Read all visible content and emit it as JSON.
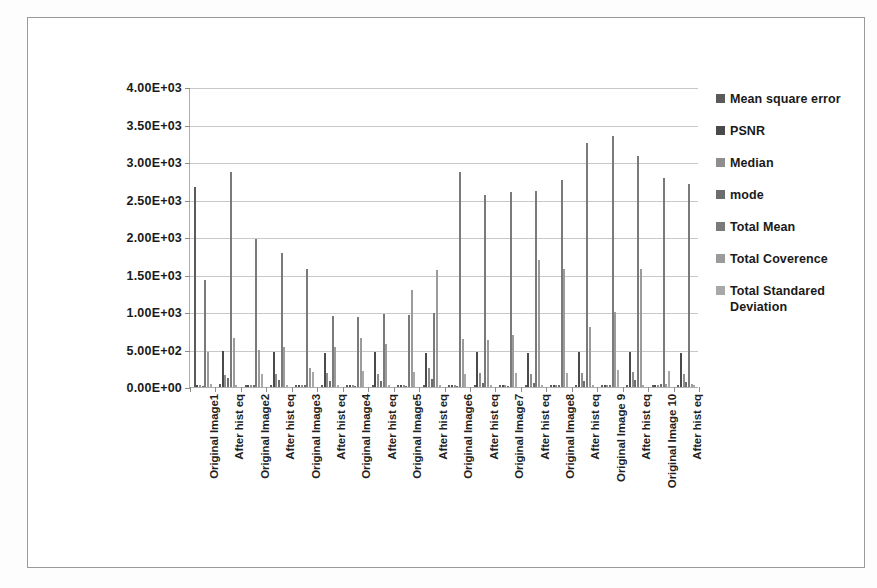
{
  "chart_data": {
    "type": "bar",
    "title": "",
    "subtitle": "",
    "xlabel": "",
    "ylabel": "",
    "grid": true,
    "legend_position": "right",
    "ylim": [
      0,
      4000
    ],
    "yticks": [
      0,
      500,
      1000,
      1500,
      2000,
      2500,
      3000,
      3500,
      4000
    ],
    "ytick_labels": [
      "0.00E+00",
      "5.00E+02",
      "1.00E+03",
      "1.50E+03",
      "2.00E+03",
      "2.50E+03",
      "3.00E+03",
      "3.50E+03",
      "4.00E+03"
    ],
    "categories": [
      "Original Image1",
      "After hist eq",
      "Original Image2",
      "After hist eq",
      "Original Image3",
      "After hist eq",
      "Original Image4",
      "After hist eq",
      "Original Image5",
      "After hist eq",
      "Original Image6",
      "After hist eq",
      "Original Image7",
      "After hist eq",
      "Original Image8",
      "After hist eq",
      "Original Image 9",
      "After hist eq",
      "Original Image 10",
      "After hist eq"
    ],
    "series": [
      {
        "name": "Mean square error",
        "color": "#5a5a5a",
        "values": [
          2670,
          35,
          25,
          30,
          25,
          25,
          30,
          25,
          30,
          25,
          30,
          25,
          30,
          25,
          30,
          25,
          30,
          25,
          30,
          25
        ]
      },
      {
        "name": "PSNR",
        "color": "#4a4a4a",
        "values": [
          30,
          480,
          25,
          470,
          30,
          460,
          30,
          470,
          30,
          460,
          30,
          470,
          30,
          460,
          30,
          465,
          30,
          470,
          30,
          460
        ]
      },
      {
        "name": "Median",
        "color": "#8e8e8e",
        "values": [
          30,
          165,
          25,
          175,
          25,
          190,
          30,
          175,
          25,
          250,
          25,
          190,
          25,
          170,
          30,
          185,
          30,
          200,
          30,
          180
        ]
      },
      {
        "name": "mode",
        "color": "#6d6d6d",
        "values": [
          20,
          120,
          30,
          95,
          25,
          80,
          20,
          75,
          20,
          110,
          20,
          60,
          20,
          55,
          25,
          75,
          30,
          95,
          35,
          70
        ]
      },
      {
        "name": "Total Mean",
        "color": "#7a7a7a",
        "values": [
          1430,
          2870,
          1980,
          1790,
          1570,
          950,
          940,
          975,
          960,
          985,
          2870,
          2560,
          2600,
          2620,
          2760,
          3260,
          3350,
          3080,
          2790,
          2710
        ]
      },
      {
        "name": "Total Coverence",
        "color": "#9b9b9b",
        "values": [
          470,
          650,
          490,
          540,
          250,
          540,
          660,
          580,
          1290,
          1560,
          640,
          630,
          700,
          1700,
          1570,
          800,
          1000,
          1570,
          40,
          35
        ]
      },
      {
        "name": "Total Standared Deviation",
        "color": "#a8a8a8",
        "values": [
          35,
          25,
          180,
          30,
          195,
          25,
          215,
          25,
          200,
          25,
          180,
          25,
          185,
          25,
          190,
          25,
          230,
          25,
          215,
          30
        ]
      }
    ],
    "bars": [
      [
        2670,
        30,
        30,
        20,
        1430,
        470,
        35
      ],
      [
        35,
        480,
        165,
        120,
        2870,
        650,
        25
      ],
      [
        25,
        25,
        25,
        30,
        1980,
        490,
        180
      ],
      [
        30,
        470,
        175,
        95,
        1790,
        540,
        30
      ],
      [
        25,
        30,
        25,
        25,
        1570,
        250,
        195
      ],
      [
        25,
        460,
        190,
        80,
        950,
        540,
        25
      ],
      [
        30,
        30,
        30,
        20,
        940,
        660,
        215
      ],
      [
        25,
        470,
        175,
        75,
        975,
        580,
        25
      ],
      [
        30,
        30,
        25,
        20,
        960,
        1290,
        200
      ],
      [
        25,
        460,
        250,
        110,
        985,
        1560,
        25
      ],
      [
        30,
        30,
        25,
        20,
        2870,
        640,
        180
      ],
      [
        25,
        470,
        190,
        60,
        2560,
        630,
        25
      ],
      [
        30,
        30,
        25,
        20,
        2600,
        700,
        185
      ],
      [
        25,
        460,
        170,
        55,
        2620,
        1700,
        25
      ],
      [
        30,
        30,
        30,
        25,
        2760,
        1570,
        190
      ],
      [
        25,
        465,
        185,
        75,
        3260,
        800,
        25
      ],
      [
        30,
        30,
        30,
        30,
        3350,
        1000,
        230
      ],
      [
        25,
        470,
        200,
        95,
        3080,
        1570,
        25
      ],
      [
        30,
        30,
        30,
        35,
        2790,
        40,
        215
      ],
      [
        25,
        460,
        180,
        70,
        2710,
        35,
        30
      ]
    ]
  },
  "legend": {
    "items": [
      {
        "label": "Mean square error",
        "color": "#5a5a5a"
      },
      {
        "label": "PSNR",
        "color": "#4a4a4a"
      },
      {
        "label": "Median",
        "color": "#8e8e8e"
      },
      {
        "label": "mode",
        "color": "#6d6d6d"
      },
      {
        "label": "Total Mean",
        "color": "#7a7a7a"
      },
      {
        "label": "Total Coverence",
        "color": "#9b9b9b"
      },
      {
        "label": "Total Standared Deviation",
        "color": "#a8a8a8"
      }
    ]
  },
  "colors": {
    "grid": "#c9c9c9",
    "axis": "#aeaeae",
    "frame": "#9a9a9a",
    "text": "#1a1a1a",
    "background": "#ffffff"
  }
}
